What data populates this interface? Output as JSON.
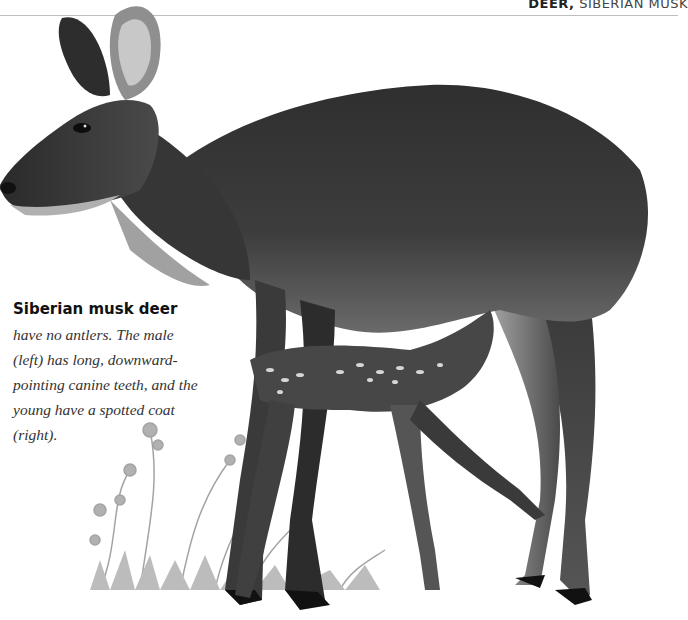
{
  "running_head": {
    "section": "DEER,",
    "subject": "SIBERIAN MUSK"
  },
  "illustration": {
    "subject": "Siberian musk deer adult with suckling spotted fawn among wildflowers",
    "colors": {
      "fur_dark": "#2b2b2b",
      "fur_mid": "#5a5a5a",
      "fur_light": "#9a9a9a",
      "plants": "#a8a8a8",
      "rule": "#bdbdbd"
    }
  },
  "caption": {
    "lead": "Siberian musk deer",
    "text": " have no antlers. The male (left) has long, downward-pointing canine teeth, and the young have a spotted coat (right)."
  }
}
